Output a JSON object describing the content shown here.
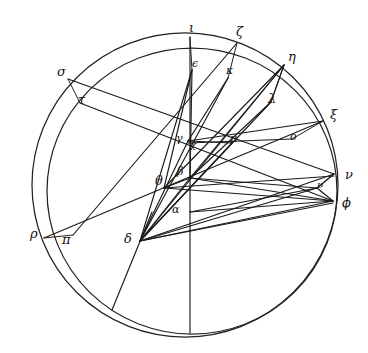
{
  "figure": {
    "background_color": "#ffffff",
    "stroke_color": "#262220",
    "width": 368,
    "height": 353
  },
  "circles": [
    {
      "name": "outer-circle",
      "cx": 185,
      "cy": 185,
      "r": 153,
      "rotation": 0
    },
    {
      "name": "inner-circle",
      "cx": 190,
      "cy": 192,
      "r": 144,
      "rotation": 0
    }
  ],
  "labels": [
    {
      "id": "iota",
      "glyph": "ι",
      "x": 189,
      "y": 21,
      "size": "normal"
    },
    {
      "id": "zeta",
      "glyph": "ζ",
      "x": 236,
      "y": 25,
      "size": "normal"
    },
    {
      "id": "eta",
      "glyph": "η",
      "x": 288,
      "y": 50,
      "size": "normal"
    },
    {
      "id": "epsilon",
      "glyph": "ϵ",
      "x": 192,
      "y": 58,
      "size": "small"
    },
    {
      "id": "kappa",
      "glyph": "κ",
      "x": 226,
      "y": 65,
      "size": "small"
    },
    {
      "id": "sigma",
      "glyph": "σ",
      "x": 57,
      "y": 65,
      "size": "normal"
    },
    {
      "id": "lambda",
      "glyph": "λ",
      "x": 268,
      "y": 92,
      "size": "normal"
    },
    {
      "id": "tau",
      "glyph": "τ",
      "x": 78,
      "y": 93,
      "size": "normal"
    },
    {
      "id": "xi",
      "glyph": "ξ",
      "x": 330,
      "y": 108,
      "size": "normal"
    },
    {
      "id": "omicron",
      "glyph": "ο",
      "x": 290,
      "y": 131,
      "size": "small"
    },
    {
      "id": "gamma",
      "glyph": "γ",
      "x": 176,
      "y": 133,
      "size": "small"
    },
    {
      "id": "mu",
      "glyph": "μ",
      "x": 230,
      "y": 133,
      "size": "small"
    },
    {
      "id": "chi",
      "glyph": "χ",
      "x": 190,
      "y": 140,
      "size": "tiny"
    },
    {
      "id": "nu",
      "glyph": "ν",
      "x": 345,
      "y": 168,
      "size": "normal"
    },
    {
      "id": "beta",
      "glyph": "β",
      "x": 177,
      "y": 166,
      "size": "small"
    },
    {
      "id": "theta",
      "glyph": "θ",
      "x": 155,
      "y": 174,
      "size": "normal"
    },
    {
      "id": "upsilon",
      "glyph": "υ",
      "x": 317,
      "y": 180,
      "size": "tiny"
    },
    {
      "id": "phi",
      "glyph": "ϕ",
      "x": 342,
      "y": 196,
      "size": "normal"
    },
    {
      "id": "alpha",
      "glyph": "α",
      "x": 172,
      "y": 204,
      "size": "small"
    },
    {
      "id": "rho",
      "glyph": "ρ",
      "x": 30,
      "y": 227,
      "size": "normal"
    },
    {
      "id": "pi",
      "glyph": "π",
      "x": 62,
      "y": 233,
      "size": "normal"
    },
    {
      "id": "delta",
      "glyph": "δ",
      "x": 124,
      "y": 232,
      "size": "normal"
    }
  ],
  "points": {
    "iota": {
      "x": 190,
      "y": 37
    },
    "zeta": {
      "x": 237,
      "y": 43
    },
    "eta": {
      "x": 284,
      "y": 65
    },
    "epsilon": {
      "x": 192,
      "y": 70
    },
    "kappa": {
      "x": 228,
      "y": 78
    },
    "sigma": {
      "x": 68,
      "y": 79
    },
    "lambda": {
      "x": 271,
      "y": 102
    },
    "tau": {
      "x": 80,
      "y": 103
    },
    "xi": {
      "x": 323,
      "y": 121
    },
    "omicron": {
      "x": 292,
      "y": 139
    },
    "gamma": {
      "x": 188,
      "y": 141
    },
    "mu": {
      "x": 232,
      "y": 143
    },
    "chi": {
      "x": 190,
      "y": 148
    },
    "nu": {
      "x": 334,
      "y": 174
    },
    "beta": {
      "x": 190,
      "y": 178
    },
    "theta": {
      "x": 164,
      "y": 188
    },
    "upsilon": {
      "x": 317,
      "y": 188
    },
    "phi": {
      "x": 333,
      "y": 201
    },
    "alpha": {
      "x": 190,
      "y": 212
    },
    "rho": {
      "x": 44,
      "y": 238
    },
    "pi": {
      "x": 73,
      "y": 235
    },
    "delta": {
      "x": 140,
      "y": 241
    }
  },
  "segments": [
    {
      "name": "iota-vertical-axis",
      "from": "iota",
      "to": "bottom-inner"
    },
    {
      "name": "sigma-to-nu-diameter",
      "from": "sigma",
      "to": "nu"
    },
    {
      "name": "rho-to-xi-diameter",
      "from": "rho",
      "to": "xi"
    },
    {
      "name": "tau-to-phi",
      "from": "tau",
      "to": "phi"
    },
    {
      "name": "pi-to-zeta",
      "from": "pi",
      "to": "zeta"
    },
    {
      "name": "eta-through-center",
      "from": "eta",
      "to": "theta"
    },
    {
      "name": "epsilon-to-delta",
      "from": "epsilon",
      "to": "delta"
    },
    {
      "name": "epsilon-to-theta",
      "from": "epsilon",
      "to": "theta"
    },
    {
      "name": "epsilon-to-beta",
      "from": "epsilon",
      "to": "beta"
    },
    {
      "name": "delta-to-eta",
      "from": "delta",
      "to": "eta"
    },
    {
      "name": "delta-to-lambda",
      "from": "delta",
      "to": "lambda"
    },
    {
      "name": "delta-to-upsilon",
      "from": "delta",
      "to": "upsilon"
    },
    {
      "name": "delta-to-phi",
      "from": "delta",
      "to": "phi"
    },
    {
      "name": "delta-to-nu",
      "from": "delta",
      "to": "nu"
    },
    {
      "name": "delta-to-gamma",
      "from": "delta",
      "to": "gamma"
    },
    {
      "name": "delta-to-beta",
      "from": "delta",
      "to": "beta"
    },
    {
      "name": "beta-to-phi",
      "from": "beta",
      "to": "phi"
    },
    {
      "name": "beta-to-upsilon",
      "from": "beta",
      "to": "upsilon"
    },
    {
      "name": "beta-to-eta",
      "from": "beta",
      "to": "eta"
    },
    {
      "name": "beta-to-lambda",
      "from": "beta",
      "to": "lambda"
    },
    {
      "name": "theta-to-nu",
      "from": "theta",
      "to": "nu"
    },
    {
      "name": "theta-to-phi",
      "from": "theta",
      "to": "phi"
    },
    {
      "name": "alpha-to-phi",
      "from": "alpha",
      "to": "phi"
    },
    {
      "name": "alpha-to-upsilon",
      "from": "alpha",
      "to": "upsilon"
    },
    {
      "name": "gamma-to-xi",
      "from": "gamma",
      "to": "xi"
    },
    {
      "name": "gamma-to-mu",
      "from": "gamma",
      "to": "mu"
    },
    {
      "name": "eta-to-lambda",
      "from": "eta",
      "to": "lambda"
    },
    {
      "name": "kappa-to-gamma",
      "from": "kappa",
      "to": "gamma"
    },
    {
      "name": "delta-lower-extension",
      "from": "delta",
      "to": "lower-arc"
    }
  ]
}
